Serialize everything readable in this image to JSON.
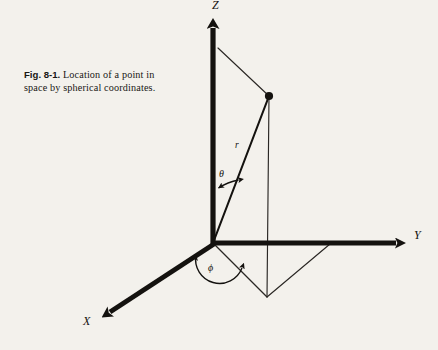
{
  "figure": {
    "caption": {
      "number": "Fig. 8-1.",
      "text": " Location of a point in space by spherical coordinates."
    },
    "background_color": "#f3f1ec",
    "ink_color": "#14120f",
    "axes": [
      {
        "id": "z",
        "label": "Z",
        "direction": "up",
        "origin": [
          213,
          243
        ],
        "tip": [
          213,
          15
        ]
      },
      {
        "id": "y",
        "label": "Y",
        "direction": "right",
        "origin": [
          213,
          243
        ],
        "tip": [
          408,
          243
        ]
      },
      {
        "id": "x",
        "label": "X",
        "direction": "down-left",
        "origin": [
          213,
          243
        ],
        "tip": [
          100,
          318
        ]
      }
    ],
    "angles": [
      {
        "id": "theta",
        "label": "θ",
        "between": "Z-axis and r",
        "vertex": [
          213,
          243
        ]
      },
      {
        "id": "phi",
        "label": "ϕ",
        "between": "X-axis and projection of r",
        "vertex": [
          213,
          243
        ]
      }
    ],
    "radial": {
      "id": "r",
      "label": "r",
      "from": [
        213,
        243
      ],
      "to": [
        269,
        96
      ]
    },
    "point": {
      "id": "P",
      "coords": [
        269,
        96
      ]
    },
    "construction_lines": [
      {
        "from": [
          218,
          48
        ],
        "to": [
          269,
          96
        ]
      },
      {
        "from": [
          269,
          96
        ],
        "to": [
          267,
          297
        ]
      },
      {
        "from": [
          213,
          243
        ],
        "to": [
          267,
          297
        ]
      },
      {
        "from": [
          267,
          297
        ],
        "to": [
          330,
          244
        ]
      }
    ]
  }
}
